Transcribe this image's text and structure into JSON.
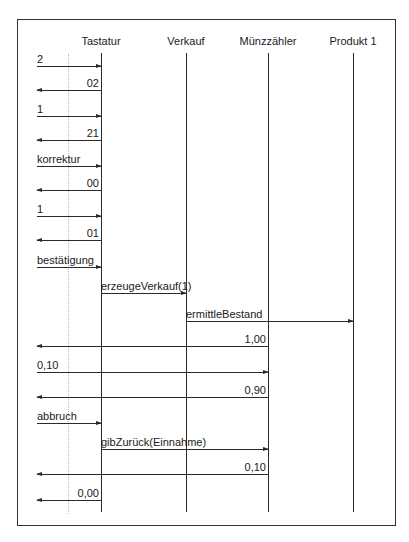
{
  "diagram": {
    "type": "sequence",
    "lifelines": [
      {
        "name": "Tastatur",
        "x": 101
      },
      {
        "name": "Verkauf",
        "x": 186
      },
      {
        "name": "Münzzähler",
        "x": 268
      },
      {
        "name": "Produkt 1",
        "x": 353
      }
    ],
    "messages": [
      {
        "label": "2",
        "from": "actor",
        "to": "Tastatur",
        "direction": "right",
        "y": 66
      },
      {
        "label": "02",
        "from": "Tastatur",
        "to": "actor",
        "direction": "left",
        "y": 90
      },
      {
        "label": "1",
        "from": "actor",
        "to": "Tastatur",
        "direction": "right",
        "y": 116
      },
      {
        "label": "21",
        "from": "Tastatur",
        "to": "actor",
        "direction": "left",
        "y": 140
      },
      {
        "label": "korrektur",
        "from": "actor",
        "to": "Tastatur",
        "direction": "right",
        "y": 166
      },
      {
        "label": "00",
        "from": "Tastatur",
        "to": "actor",
        "direction": "left",
        "y": 190
      },
      {
        "label": "1",
        "from": "actor",
        "to": "Tastatur",
        "direction": "right",
        "y": 216
      },
      {
        "label": "01",
        "from": "Tastatur",
        "to": "actor",
        "direction": "left",
        "y": 240
      },
      {
        "label": "bestätigung",
        "from": "actor",
        "to": "Tastatur",
        "direction": "right",
        "y": 267
      },
      {
        "label": "erzeugeVerkauf(1)",
        "from": "Tastatur",
        "to": "Verkauf",
        "direction": "right",
        "y": 293
      },
      {
        "label": "ermittleBestand",
        "from": "Verkauf",
        "to": "Produkt 1",
        "direction": "right",
        "y": 321
      },
      {
        "label": "1,00",
        "from": "Münzzähler",
        "to": "actor",
        "direction": "left",
        "y": 346
      },
      {
        "label": "0,10",
        "from": "actor",
        "to": "Münzzähler",
        "direction": "right",
        "y": 372
      },
      {
        "label": "0,90",
        "from": "Münzzähler",
        "to": "actor",
        "direction": "left",
        "y": 397
      },
      {
        "label": "abbruch",
        "from": "actor",
        "to": "Tastatur",
        "direction": "right",
        "y": 423
      },
      {
        "label": "gibZurück(Einnahme)",
        "from": "Tastatur",
        "to": "Münzzähler",
        "direction": "right",
        "y": 449
      },
      {
        "label": "0,10",
        "from": "Münzzähler",
        "to": "actor",
        "direction": "left",
        "y": 474
      },
      {
        "label": "0,00",
        "from": "Tastatur",
        "to": "actor",
        "direction": "left",
        "y": 500
      }
    ]
  }
}
